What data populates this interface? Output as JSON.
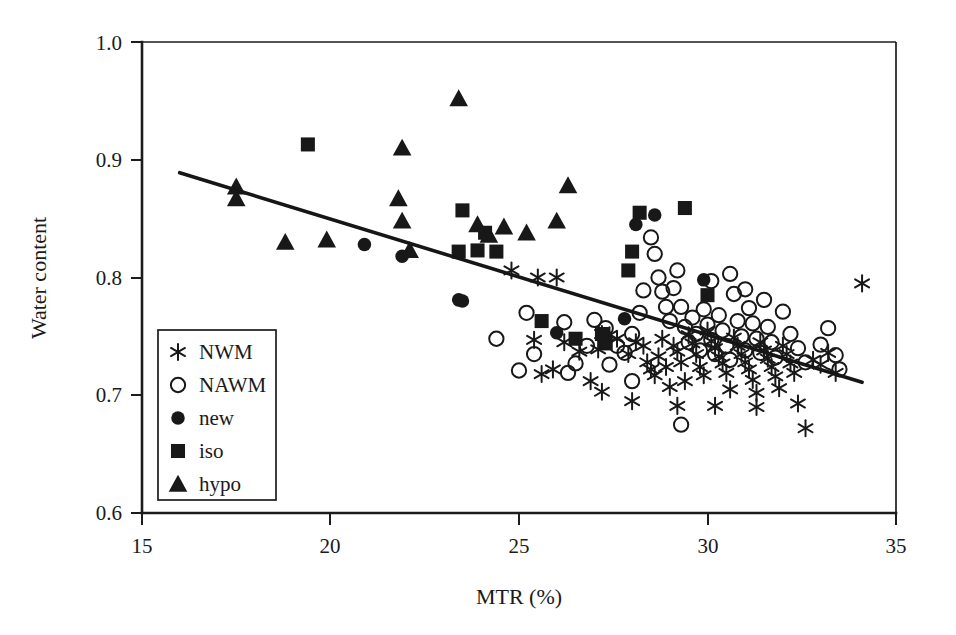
{
  "chart_data": {
    "type": "scatter",
    "title": "",
    "xlabel": "MTR (%)",
    "ylabel": "Water content",
    "xlim": [
      15,
      35
    ],
    "ylim": [
      0.6,
      1.0
    ],
    "xticks": [
      "15",
      "20",
      "25",
      "30",
      "35"
    ],
    "yticks": [
      "0.6",
      "0.7",
      "0.8",
      "0.9",
      "1.0"
    ],
    "grid": false,
    "legend_position": "lower-left-inside",
    "legend_entries": [
      {
        "label": "NWM",
        "marker": "asterisk"
      },
      {
        "label": "NAWM",
        "marker": "open-circle"
      },
      {
        "label": "new",
        "marker": "filled-circle"
      },
      {
        "label": "iso",
        "marker": "filled-square"
      },
      {
        "label": "hypo",
        "marker": "filled-triangle"
      }
    ],
    "trendline": {
      "type": "linear-regression",
      "x": [
        16.0,
        34.1
      ],
      "y": [
        0.889,
        0.711
      ]
    },
    "series": [
      {
        "name": "NWM",
        "marker": "asterisk",
        "points": [
          [
            24.8,
            0.806
          ],
          [
            25.5,
            0.8
          ],
          [
            26.0,
            0.8
          ],
          [
            25.4,
            0.747
          ],
          [
            25.6,
            0.718
          ],
          [
            25.9,
            0.722
          ],
          [
            26.2,
            0.745
          ],
          [
            26.6,
            0.737
          ],
          [
            27.1,
            0.739
          ],
          [
            27.2,
            0.752
          ],
          [
            27.4,
            0.751
          ],
          [
            27.6,
            0.748
          ],
          [
            27.9,
            0.735
          ],
          [
            28.1,
            0.745
          ],
          [
            28.3,
            0.742
          ],
          [
            28.4,
            0.728
          ],
          [
            28.5,
            0.722
          ],
          [
            28.6,
            0.717
          ],
          [
            28.7,
            0.733
          ],
          [
            28.8,
            0.748
          ],
          [
            28.9,
            0.724
          ],
          [
            29.0,
            0.707
          ],
          [
            29.1,
            0.742
          ],
          [
            29.2,
            0.737
          ],
          [
            29.3,
            0.728
          ],
          [
            29.4,
            0.712
          ],
          [
            29.5,
            0.751
          ],
          [
            29.6,
            0.744
          ],
          [
            29.7,
            0.735
          ],
          [
            29.8,
            0.724
          ],
          [
            29.9,
            0.717
          ],
          [
            30.0,
            0.755
          ],
          [
            30.1,
            0.746
          ],
          [
            30.2,
            0.74
          ],
          [
            30.3,
            0.733
          ],
          [
            30.4,
            0.727
          ],
          [
            30.5,
            0.719
          ],
          [
            30.6,
            0.705
          ],
          [
            30.7,
            0.749
          ],
          [
            30.8,
            0.742
          ],
          [
            30.9,
            0.735
          ],
          [
            31.0,
            0.728
          ],
          [
            31.1,
            0.722
          ],
          [
            31.2,
            0.713
          ],
          [
            31.3,
            0.702
          ],
          [
            31.4,
            0.745
          ],
          [
            31.5,
            0.738
          ],
          [
            31.6,
            0.731
          ],
          [
            31.7,
            0.724
          ],
          [
            31.8,
            0.716
          ],
          [
            31.9,
            0.706
          ],
          [
            32.0,
            0.742
          ],
          [
            32.1,
            0.735
          ],
          [
            32.2,
            0.727
          ],
          [
            32.3,
            0.719
          ],
          [
            32.4,
            0.693
          ],
          [
            32.6,
            0.672
          ],
          [
            32.8,
            0.73
          ],
          [
            33.0,
            0.726
          ],
          [
            33.2,
            0.736
          ],
          [
            33.4,
            0.719
          ],
          [
            31.3,
            0.69
          ],
          [
            30.2,
            0.691
          ],
          [
            29.2,
            0.691
          ],
          [
            28.0,
            0.695
          ],
          [
            27.2,
            0.703
          ],
          [
            26.9,
            0.712
          ],
          [
            34.1,
            0.795
          ]
        ]
      },
      {
        "name": "NAWM",
        "marker": "open-circle",
        "points": [
          [
            24.4,
            0.748
          ],
          [
            25.2,
            0.77
          ],
          [
            25.0,
            0.721
          ],
          [
            25.4,
            0.735
          ],
          [
            26.2,
            0.762
          ],
          [
            26.5,
            0.727
          ],
          [
            27.0,
            0.764
          ],
          [
            27.3,
            0.757
          ],
          [
            27.6,
            0.742
          ],
          [
            27.8,
            0.736
          ],
          [
            28.0,
            0.752
          ],
          [
            28.2,
            0.77
          ],
          [
            28.3,
            0.789
          ],
          [
            28.5,
            0.834
          ],
          [
            28.6,
            0.82
          ],
          [
            28.7,
            0.8
          ],
          [
            28.8,
            0.788
          ],
          [
            28.9,
            0.775
          ],
          [
            29.0,
            0.763
          ],
          [
            29.1,
            0.791
          ],
          [
            29.2,
            0.806
          ],
          [
            29.3,
            0.775
          ],
          [
            29.4,
            0.758
          ],
          [
            29.5,
            0.745
          ],
          [
            29.6,
            0.766
          ],
          [
            29.7,
            0.752
          ],
          [
            29.8,
            0.738
          ],
          [
            29.9,
            0.773
          ],
          [
            30.0,
            0.76
          ],
          [
            30.1,
            0.747
          ],
          [
            30.2,
            0.735
          ],
          [
            30.3,
            0.768
          ],
          [
            30.4,
            0.755
          ],
          [
            30.5,
            0.742
          ],
          [
            30.6,
            0.73
          ],
          [
            30.7,
            0.786
          ],
          [
            30.8,
            0.763
          ],
          [
            30.9,
            0.75
          ],
          [
            31.0,
            0.738
          ],
          [
            31.1,
            0.774
          ],
          [
            31.2,
            0.761
          ],
          [
            31.3,
            0.748
          ],
          [
            31.4,
            0.736
          ],
          [
            31.5,
            0.781
          ],
          [
            31.6,
            0.758
          ],
          [
            31.7,
            0.745
          ],
          [
            31.8,
            0.732
          ],
          [
            32.0,
            0.771
          ],
          [
            32.2,
            0.752
          ],
          [
            32.4,
            0.74
          ],
          [
            32.6,
            0.728
          ],
          [
            33.0,
            0.743
          ],
          [
            33.2,
            0.757
          ],
          [
            33.4,
            0.734
          ],
          [
            33.5,
            0.722
          ],
          [
            29.3,
            0.675
          ],
          [
            28.0,
            0.712
          ],
          [
            27.4,
            0.726
          ],
          [
            26.8,
            0.742
          ],
          [
            26.3,
            0.719
          ],
          [
            30.6,
            0.803
          ],
          [
            30.1,
            0.797
          ],
          [
            31.0,
            0.79
          ]
        ]
      },
      {
        "name": "new",
        "marker": "filled-circle",
        "points": [
          [
            20.9,
            0.828
          ],
          [
            21.9,
            0.818
          ],
          [
            23.4,
            0.781
          ],
          [
            23.5,
            0.78
          ],
          [
            27.8,
            0.765
          ],
          [
            28.1,
            0.845
          ],
          [
            28.6,
            0.853
          ],
          [
            29.9,
            0.798
          ],
          [
            27.3,
            0.75
          ],
          [
            26.0,
            0.753
          ]
        ]
      },
      {
        "name": "iso",
        "marker": "filled-square",
        "points": [
          [
            19.4,
            0.913
          ],
          [
            23.5,
            0.857
          ],
          [
            23.4,
            0.822
          ],
          [
            23.9,
            0.823
          ],
          [
            24.1,
            0.838
          ],
          [
            24.4,
            0.822
          ],
          [
            25.6,
            0.763
          ],
          [
            27.2,
            0.752
          ],
          [
            27.3,
            0.744
          ],
          [
            27.9,
            0.806
          ],
          [
            28.0,
            0.822
          ],
          [
            28.2,
            0.855
          ],
          [
            29.4,
            0.859
          ],
          [
            30.0,
            0.785
          ],
          [
            26.5,
            0.748
          ]
        ]
      },
      {
        "name": "hypo",
        "marker": "filled-triangle",
        "points": [
          [
            17.5,
            0.877
          ],
          [
            17.5,
            0.867
          ],
          [
            18.8,
            0.83
          ],
          [
            19.9,
            0.832
          ],
          [
            21.8,
            0.867
          ],
          [
            21.9,
            0.848
          ],
          [
            21.9,
            0.91
          ],
          [
            22.1,
            0.823
          ],
          [
            23.4,
            0.952
          ],
          [
            23.9,
            0.845
          ],
          [
            24.2,
            0.836
          ],
          [
            24.6,
            0.843
          ],
          [
            26.0,
            0.848
          ],
          [
            26.3,
            0.878
          ],
          [
            25.2,
            0.838
          ]
        ]
      }
    ]
  },
  "axes": {
    "x_title": "MTR (%)",
    "y_title": "Water content"
  }
}
